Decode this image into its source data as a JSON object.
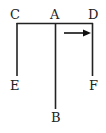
{
  "diagram": {
    "labels": {
      "C": "C",
      "A": "A",
      "D": "D",
      "E": "E",
      "F": "F",
      "B": "B"
    },
    "arrow": {
      "direction": "right",
      "color": "#111111"
    },
    "line_color": "#222222"
  }
}
